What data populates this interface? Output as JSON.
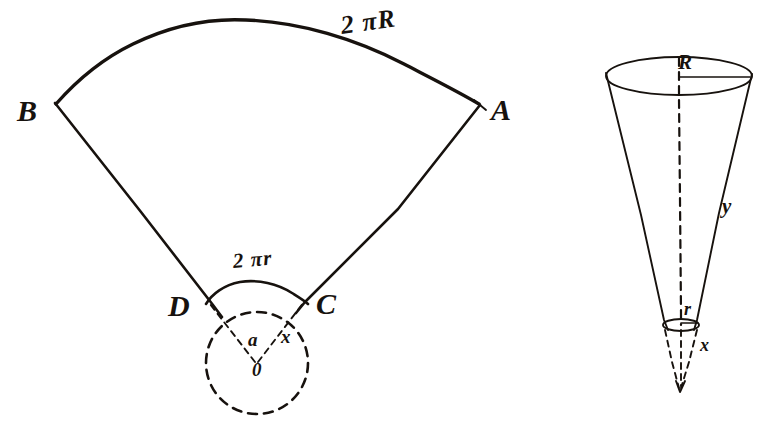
{
  "figure": {
    "background_color": "#ffffff",
    "ink_color": "#17120e",
    "width": 773,
    "height": 447
  },
  "sector": {
    "name": "unrolled-cone-sector",
    "vertices": {
      "B": {
        "label": "B",
        "x": 24,
        "y": 104
      },
      "A": {
        "label": "A",
        "x": 492,
        "y": 105
      },
      "D": {
        "label": "D",
        "x": 172,
        "y": 305
      },
      "C": {
        "label": "C",
        "x": 320,
        "y": 303
      },
      "O": {
        "label": "0",
        "x": 255,
        "y": 372
      }
    },
    "arc_outer_label": "2 πR",
    "arc_inner_label": "2 πr",
    "angle_left_label": "a",
    "angle_right_label": "x",
    "center_label": "0"
  },
  "cone": {
    "name": "truncated-cone",
    "top_radius_label": "R",
    "slant_label": "y",
    "bottom_radius_label": "r",
    "apex_extension_label": "x"
  },
  "labels": {
    "B": "B",
    "A": "A",
    "D": "D",
    "C": "C",
    "O": "0",
    "two_pi_R": "2 πR",
    "two_pi_r": "2 πr",
    "a": "a",
    "x_sector": "x",
    "R_cone": "R",
    "y_cone": "y",
    "r_cone": "r",
    "x_cone": "x"
  }
}
